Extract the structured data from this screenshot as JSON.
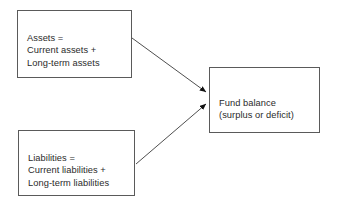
{
  "diagram": {
    "background_color": "#ffffff",
    "border_color": "#5a5a5a",
    "text_color": "#2b2b2b",
    "nodes": [
      {
        "id": "assets",
        "lines": [
          "Assets =",
          "Current assets +",
          "Long-term assets"
        ],
        "text": "Assets =\nCurrent assets +\nLong-term assets"
      },
      {
        "id": "liabilities",
        "lines": [
          "Liabilities =",
          "Current liabilities +",
          "Long-term liabilities"
        ],
        "text": "Liabilities =\nCurrent liabilities +\nLong-term liabilities"
      },
      {
        "id": "fund_balance",
        "lines": [
          "Fund balance",
          "(surplus or deficit)"
        ],
        "text": "Fund balance\n(surplus or deficit)"
      }
    ],
    "edges": [
      {
        "id": "assets-to-fund-balance",
        "from": "assets",
        "to": "fund_balance",
        "label": "",
        "arrowhead": "filled-triangle"
      },
      {
        "id": "liabilities-to-fund-balance",
        "from": "liabilities",
        "to": "fund_balance",
        "label": "",
        "arrowhead": "filled-triangle"
      }
    ]
  }
}
